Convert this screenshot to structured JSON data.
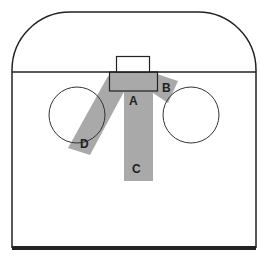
{
  "diagram": {
    "colors": {
      "line": "#222222",
      "zone_fill": "#a9a9a9",
      "background": "#ffffff"
    },
    "zones": [
      {
        "label": "A"
      },
      {
        "label": "B"
      },
      {
        "label": "C"
      },
      {
        "label": "D"
      }
    ]
  }
}
